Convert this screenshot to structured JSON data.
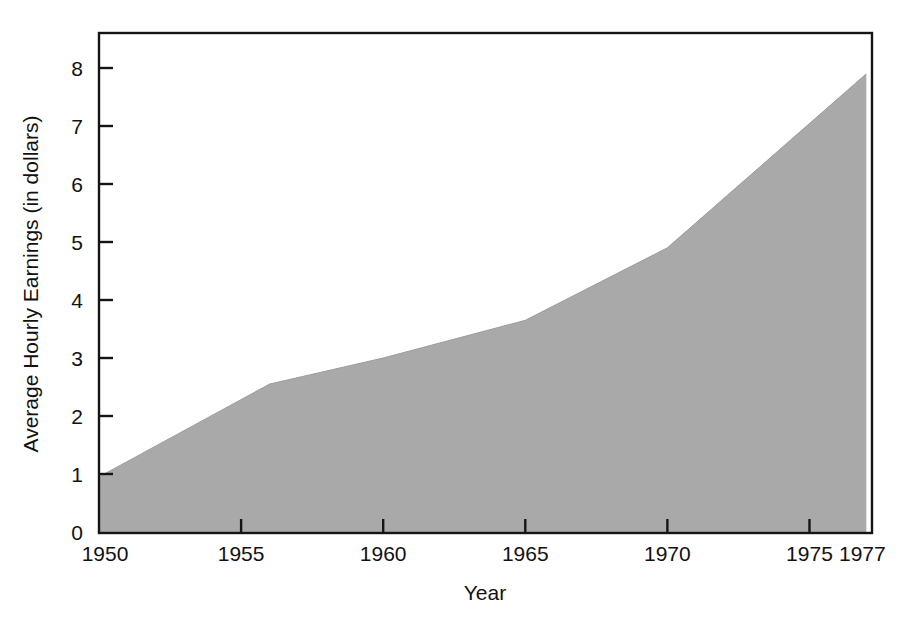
{
  "chart_data": {
    "type": "area",
    "title": "",
    "xlabel": "Year",
    "ylabel": "Average Hourly Earnings (in dollars)",
    "xlim": [
      1950,
      1977.2
    ],
    "ylim": [
      0,
      8.6
    ],
    "grid": false,
    "legend": null,
    "fill_color": "#a9a9a9",
    "axis_color": "#151515",
    "background_color": "#ffffff",
    "x_ticks": [
      {
        "value": 1950,
        "label": "1950"
      },
      {
        "value": 1955,
        "label": "1955"
      },
      {
        "value": 1960,
        "label": "1960"
      },
      {
        "value": 1965,
        "label": "1965"
      },
      {
        "value": 1970,
        "label": "1970"
      },
      {
        "value": 1975,
        "label": "1975"
      },
      {
        "value": 1977,
        "label": "1977"
      }
    ],
    "y_ticks": [
      {
        "value": 0,
        "label": "0"
      },
      {
        "value": 1,
        "label": "1"
      },
      {
        "value": 2,
        "label": "2"
      },
      {
        "value": 3,
        "label": "3"
      },
      {
        "value": 4,
        "label": "4"
      },
      {
        "value": 5,
        "label": "5"
      },
      {
        "value": 6,
        "label": "6"
      },
      {
        "value": 7,
        "label": "7"
      },
      {
        "value": 8,
        "label": "8"
      }
    ],
    "x": [
      1950,
      1956,
      1960,
      1965,
      1970,
      1977
    ],
    "values": [
      0.95,
      2.55,
      3.0,
      3.65,
      4.9,
      7.9
    ],
    "series": [
      {
        "name": "Average Hourly Earnings",
        "x": [
          1950,
          1956,
          1960,
          1965,
          1970,
          1977
        ],
        "values": [
          0.95,
          2.55,
          3.0,
          3.65,
          4.9,
          7.9
        ]
      }
    ]
  },
  "axes": {
    "x_title": "Year",
    "y_title": "Average Hourly Earnings (in dollars)"
  },
  "x_tick_labels": [
    "1950",
    "1955",
    "1960",
    "1965",
    "1970",
    "1975",
    "1977"
  ],
  "y_tick_labels": [
    "0",
    "1",
    "2",
    "3",
    "4",
    "5",
    "6",
    "7",
    "8"
  ]
}
